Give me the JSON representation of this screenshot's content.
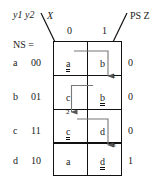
{
  "diagram": {
    "title_header": {
      "present_state_vars": "y1 y2",
      "input_var": "X",
      "output_header": "PS Z",
      "next_state_legend": "NS ="
    },
    "columns": [
      {
        "id": "col0",
        "label": "0"
      },
      {
        "id": "col1",
        "label": "1"
      }
    ],
    "rows": [
      {
        "state": "a",
        "code": "00",
        "cells": [
          {
            "text": "a",
            "stable": true
          },
          {
            "text": "b",
            "stable": false
          }
        ],
        "output": "0"
      },
      {
        "state": "b",
        "code": "01",
        "cells": [
          {
            "text": "c",
            "stable": false
          },
          {
            "text": "b",
            "stable": true
          }
        ],
        "output": "0"
      },
      {
        "state": "c",
        "code": "11",
        "cells": [
          {
            "text": "c",
            "stable": true
          },
          {
            "text": "d",
            "stable": false
          }
        ],
        "output": "0"
      },
      {
        "state": "d",
        "code": "10",
        "cells": [
          {
            "text": "a",
            "stable": false
          },
          {
            "text": "d",
            "stable": true
          }
        ],
        "output": "1"
      }
    ],
    "transitions": [
      {
        "id": "t1",
        "label": "1",
        "from": "a/1",
        "to": "b/1"
      },
      {
        "id": "t2",
        "label": "2",
        "from": "b/0",
        "to": "c/0"
      },
      {
        "id": "t3",
        "label": "3",
        "from": "c/1",
        "to": "d/1"
      }
    ],
    "colors": {
      "ink": "#111111",
      "arrow": "#6b6b6b",
      "background": "#ffffff"
    }
  }
}
